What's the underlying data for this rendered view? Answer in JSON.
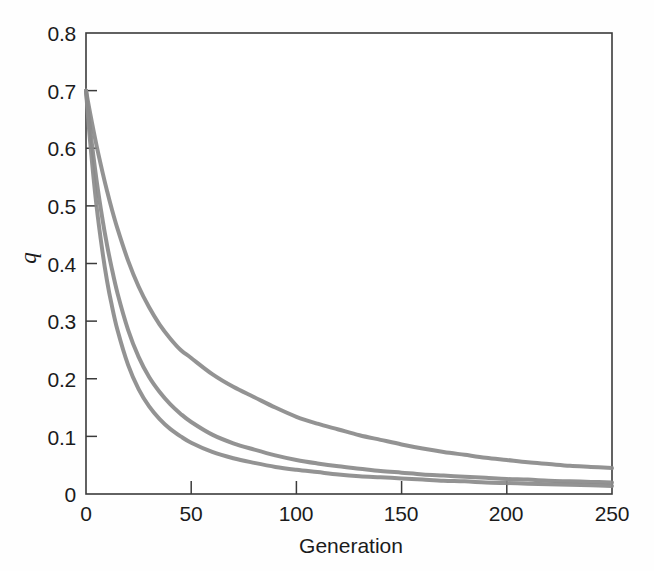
{
  "figure": {
    "background_color": "#fefefe",
    "axis_color": "#3b3b3b",
    "text_color": "#1b1b1b",
    "curve_color": "#8a8a8a"
  },
  "axes": {
    "y_title": "q",
    "x_title": "Generation",
    "y_ticks": [
      "0",
      "0.1",
      "0.2",
      "0.3",
      "0.4",
      "0.5",
      "0.6",
      "0.7",
      "0.8"
    ],
    "x_ticks": [
      "0",
      "50",
      "100",
      "150",
      "200",
      "250"
    ]
  },
  "chart_data": {
    "type": "line",
    "title": "",
    "subtitle": "",
    "xlabel": "Generation",
    "ylabel": "q",
    "xlim": [
      0,
      250
    ],
    "ylim": [
      0,
      0.8
    ],
    "xticks": [
      0,
      50,
      100,
      150,
      200,
      250
    ],
    "yticks": [
      0,
      0.1,
      0.2,
      0.3,
      0.4,
      0.5,
      0.6,
      0.7,
      0.8
    ],
    "grid": false,
    "legend": "none",
    "annotations": [],
    "x": [
      0,
      2,
      5,
      8,
      10,
      12,
      15,
      20,
      25,
      30,
      35,
      40,
      45,
      50,
      60,
      70,
      80,
      90,
      100,
      110,
      120,
      130,
      140,
      150,
      160,
      170,
      180,
      190,
      200,
      210,
      220,
      230,
      240,
      250
    ],
    "series": [
      {
        "name": "curve-1-slow-decay",
        "color": "#8a8a8a",
        "values": [
          0.7,
          0.66,
          0.605,
          0.556,
          0.526,
          0.498,
          0.46,
          0.405,
          0.36,
          0.324,
          0.294,
          0.27,
          0.25,
          0.236,
          0.208,
          0.186,
          0.168,
          0.15,
          0.134,
          0.122,
          0.112,
          0.102,
          0.094,
          0.086,
          0.079,
          0.073,
          0.068,
          0.063,
          0.059,
          0.055,
          0.052,
          0.049,
          0.047,
          0.045
        ]
      },
      {
        "name": "curve-2-medium-decay",
        "color": "#8a8a8a",
        "values": [
          0.7,
          0.632,
          0.545,
          0.473,
          0.432,
          0.396,
          0.348,
          0.285,
          0.238,
          0.203,
          0.177,
          0.156,
          0.139,
          0.125,
          0.103,
          0.088,
          0.077,
          0.067,
          0.059,
          0.053,
          0.048,
          0.044,
          0.04,
          0.037,
          0.034,
          0.032,
          0.03,
          0.028,
          0.026,
          0.025,
          0.023,
          0.022,
          0.021,
          0.02
        ]
      },
      {
        "name": "curve-3-fast-decay",
        "color": "#8a8a8a",
        "values": [
          0.7,
          0.61,
          0.5,
          0.416,
          0.37,
          0.332,
          0.284,
          0.224,
          0.182,
          0.152,
          0.13,
          0.113,
          0.1,
          0.089,
          0.073,
          0.062,
          0.054,
          0.047,
          0.042,
          0.038,
          0.034,
          0.031,
          0.029,
          0.027,
          0.025,
          0.023,
          0.022,
          0.02,
          0.019,
          0.018,
          0.017,
          0.016,
          0.015,
          0.014
        ]
      }
    ]
  }
}
